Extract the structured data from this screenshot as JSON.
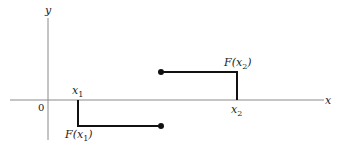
{
  "diagram": {
    "type": "step-function-graph",
    "axes": {
      "x_label": "x",
      "y_label": "y",
      "origin_label": "0"
    },
    "points": {
      "x1_label": "x",
      "x1_sub": "1",
      "x2_label": "x",
      "x2_sub": "2",
      "Fx1_prefix": "F(x",
      "Fx1_sub": "1",
      "Fx1_suffix": ")",
      "Fx2_prefix": "F(x",
      "Fx2_sub": "2",
      "Fx2_suffix": ")"
    },
    "colors": {
      "axis": "#8a8a8a",
      "curve": "#111111",
      "text": "#222222"
    }
  }
}
